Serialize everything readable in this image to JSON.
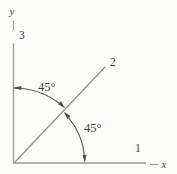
{
  "figure": {
    "description_colors": {
      "background": "#fcfcf9",
      "axis_line": "#9a9a9a",
      "diagonal_line": "#8d8d8d",
      "arc_line": "#5a5a5a",
      "arrowhead": "#4d4d4d",
      "text": "#3d3d3d"
    },
    "axis_letters": {
      "y": "y",
      "x": "x"
    },
    "axis_numbers": {
      "axis1": "1",
      "axis2": "2",
      "axis3": "3"
    },
    "angle_labels": {
      "upper": "45°",
      "lower": "45°"
    }
  }
}
